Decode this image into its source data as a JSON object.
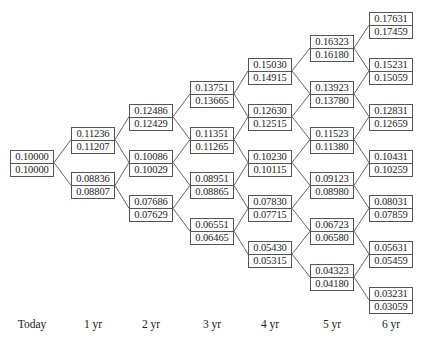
{
  "diagram": {
    "type": "binomial-interest-rate-tree",
    "periods": [
      "Today",
      "1 yr",
      "2 yr",
      "3 yr",
      "4 yr",
      "5 yr",
      "6 yr"
    ],
    "columns": [
      {
        "label": "Today",
        "nodes": [
          {
            "upper": "0.10000",
            "lower": "0.10000"
          }
        ]
      },
      {
        "label": "1 yr",
        "nodes": [
          {
            "upper": "0.11236",
            "lower": "0.11207"
          },
          {
            "upper": "0.08836",
            "lower": "0.08807"
          }
        ]
      },
      {
        "label": "2 yr",
        "nodes": [
          {
            "upper": "0.12486",
            "lower": "0.12429"
          },
          {
            "upper": "0.10086",
            "lower": "0.10029"
          },
          {
            "upper": "0.07686",
            "lower": "0.07629"
          }
        ]
      },
      {
        "label": "3 yr",
        "nodes": [
          {
            "upper": "0.13751",
            "lower": "0.13665"
          },
          {
            "upper": "0.11351",
            "lower": "0.11265"
          },
          {
            "upper": "0.08951",
            "lower": "0.08865"
          },
          {
            "upper": "0.06551",
            "lower": "0.06465"
          }
        ]
      },
      {
        "label": "4 yr",
        "nodes": [
          {
            "upper": "0.15030",
            "lower": "0.14915"
          },
          {
            "upper": "0.12630",
            "lower": "0.12515"
          },
          {
            "upper": "0.10230",
            "lower": "0.10115"
          },
          {
            "upper": "0.07830",
            "lower": "0.07715"
          },
          {
            "upper": "0.05430",
            "lower": "0.05315"
          }
        ]
      },
      {
        "label": "5 yr",
        "nodes": [
          {
            "upper": "0.16323",
            "lower": "0.16180"
          },
          {
            "upper": "0.13923",
            "lower": "0.13780"
          },
          {
            "upper": "0.11523",
            "lower": "0.11380"
          },
          {
            "upper": "0.09123",
            "lower": "0.08980"
          },
          {
            "upper": "0.06723",
            "lower": "0.06580"
          },
          {
            "upper": "0.04323",
            "lower": "0.04180"
          }
        ]
      },
      {
        "label": "6 yr",
        "nodes": [
          {
            "upper": "0.17631",
            "lower": "0.17459"
          },
          {
            "upper": "0.15231",
            "lower": "0.15059"
          },
          {
            "upper": "0.12831",
            "lower": "0.12659"
          },
          {
            "upper": "0.10431",
            "lower": "0.10259"
          },
          {
            "upper": "0.08031",
            "lower": "0.07859"
          },
          {
            "upper": "0.05631",
            "lower": "0.05459"
          },
          {
            "upper": "0.03231",
            "lower": "0.03059"
          }
        ]
      }
    ]
  },
  "colors": {
    "line": "#555555",
    "text": "#222222",
    "background": "#ffffff"
  }
}
